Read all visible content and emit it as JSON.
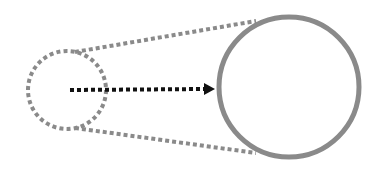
{
  "diagram": {
    "description": "Magnification/zoom diagram: small dotted circle projected with dotted tangent lines to a large solid circle, dotted arrow pointing from small circle center to large circle",
    "colors": {
      "background": "#ffffff",
      "outline_gray": "#8a8a8a",
      "arrow": "#111111"
    },
    "small_circle": {
      "cx": 67,
      "cy": 90,
      "r": 39,
      "style": "dotted"
    },
    "large_circle": {
      "cx": 289,
      "cy": 87,
      "r": 70,
      "style": "solid"
    },
    "tangent_top": {
      "x1": 75,
      "y1": 52,
      "x2": 256,
      "y2": 21
    },
    "tangent_bottom": {
      "x1": 75,
      "y1": 128,
      "x2": 256,
      "y2": 153
    },
    "arrow": {
      "x1": 70,
      "y1": 90,
      "x2": 205,
      "y2": 89,
      "head_tip_x": 215
    }
  }
}
